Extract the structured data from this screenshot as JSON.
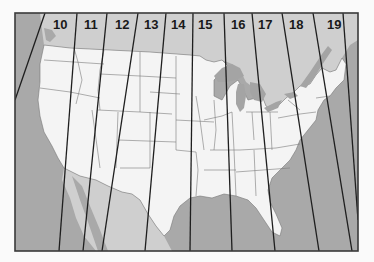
{
  "map": {
    "title": "",
    "description": "Contiguous United States with slanted zone strips numbered 10 to 19",
    "colors": {
      "background": "#fafafa",
      "ocean": "#a9a9a9",
      "foreign_land": "#cfcfcf",
      "us_land": "#f4f4f4",
      "lakes": "#a4a4a4",
      "state_borders": "#7a7a7a",
      "zone_lines": "#1e1e1e",
      "frame": "#3a3a3a"
    },
    "frame": {
      "x": 15,
      "y": 13,
      "width": 343,
      "height": 238
    },
    "zones": [
      {
        "label": "10",
        "x": 53,
        "y": 28
      },
      {
        "label": "11",
        "x": 84,
        "y": 28
      },
      {
        "label": "12",
        "x": 115,
        "y": 28
      },
      {
        "label": "13",
        "x": 144,
        "y": 28
      },
      {
        "label": "14",
        "x": 172,
        "y": 28
      },
      {
        "label": "15",
        "x": 199,
        "y": 28
      },
      {
        "label": "16",
        "x": 232,
        "y": 28
      },
      {
        "label": "17",
        "x": 259,
        "y": 28
      },
      {
        "label": "18",
        "x": 289,
        "y": 28
      },
      {
        "label": "19",
        "x": 327,
        "y": 28
      }
    ],
    "zone_lines": [
      {
        "x1": 45,
        "y1": 13,
        "x2": 15,
        "y2": 100
      },
      {
        "x1": 77,
        "y1": 13,
        "x2": 59,
        "y2": 251
      },
      {
        "x1": 107,
        "y1": 13,
        "x2": 83,
        "y2": 251
      },
      {
        "x1": 138,
        "y1": 13,
        "x2": 102,
        "y2": 251
      },
      {
        "x1": 166,
        "y1": 13,
        "x2": 145,
        "y2": 251
      },
      {
        "x1": 193,
        "y1": 13,
        "x2": 190,
        "y2": 251
      },
      {
        "x1": 224,
        "y1": 13,
        "x2": 232,
        "y2": 251
      },
      {
        "x1": 252,
        "y1": 13,
        "x2": 275,
        "y2": 251
      },
      {
        "x1": 282,
        "y1": 13,
        "x2": 319,
        "y2": 251
      },
      {
        "x1": 313,
        "y1": 13,
        "x2": 352,
        "y2": 251
      },
      {
        "x1": 343,
        "y1": 13,
        "x2": 358,
        "y2": 220
      }
    ]
  }
}
